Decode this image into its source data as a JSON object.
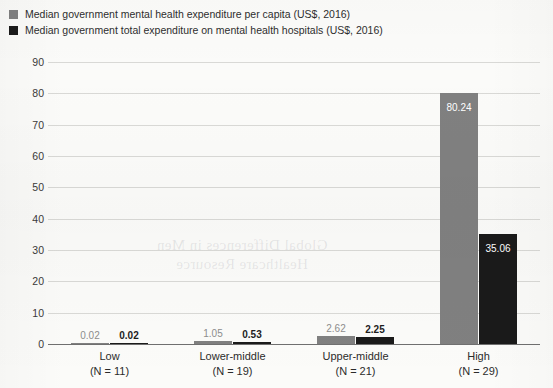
{
  "legend": {
    "items": [
      {
        "label": "Median government mental health expenditure per capita (US$, 2016)",
        "color": "#808080",
        "swatch_name": "legend-swatch-per-capita"
      },
      {
        "label": "Median government total expenditure on mental health hospitals (US$, 2016)",
        "color": "#1a1a1a",
        "swatch_name": "legend-swatch-hospitals"
      }
    ]
  },
  "watermark": {
    "line1": "Global Differences in Men",
    "line2": "Healthcare Resource"
  },
  "chart_data": {
    "type": "bar",
    "title": "",
    "subtitle": "",
    "xlabel": "",
    "ylabel": "",
    "grid": true,
    "legend_position": "top-left",
    "ylim": [
      0,
      90
    ],
    "yticks": [
      0,
      10,
      20,
      30,
      40,
      50,
      60,
      70,
      80,
      90
    ],
    "ytick_labels": [
      "0",
      "10",
      "20",
      "30",
      "40",
      "50",
      "60",
      "70",
      "80",
      "90"
    ],
    "categories": [
      "Low",
      "Lower-middle",
      "Upper-middle",
      "High"
    ],
    "category_sublabels": [
      "(N = 11)",
      "(N = 19)",
      "(N = 21)",
      "(N = 29)"
    ],
    "series": [
      {
        "name": "Median government mental health expenditure per capita (US$, 2016)",
        "color": "#808080",
        "values": [
          0.02,
          1.05,
          2.62,
          80.24
        ],
        "labels": [
          "0.02",
          "1.05",
          "2.62",
          "80.24"
        ]
      },
      {
        "name": "Median government total expenditure on mental health hospitals (US$, 2016)",
        "color": "#1a1a1a",
        "values": [
          0.02,
          0.53,
          2.25,
          35.06
        ],
        "labels": [
          "0.02",
          "0.53",
          "2.25",
          "35.06"
        ]
      }
    ]
  }
}
